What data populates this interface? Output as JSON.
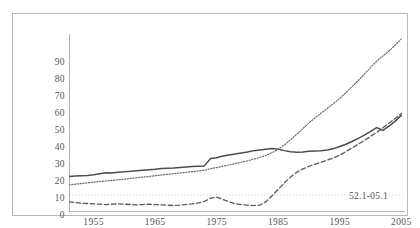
{
  "chart_data": {
    "type": "line",
    "title": "",
    "subtitle": "",
    "xlabel": "",
    "ylabel": "",
    "xlim": [
      1951,
      2005.6
    ],
    "ylim": [
      -10,
      95
    ],
    "yticks": [
      -10,
      0,
      10,
      20,
      30,
      40,
      50,
      60,
      70,
      80,
      90
    ],
    "ytick_labels": [
      "-10",
      "0",
      "10",
      "20",
      "30",
      "40",
      "50",
      "60",
      "70",
      "80",
      "90"
    ],
    "xticks": [
      1955,
      1965,
      1975,
      1985,
      1995,
      2005
    ],
    "xtick_labels": [
      "1955",
      "1965",
      "1975",
      "1985",
      "1995",
      "2005"
    ],
    "x_minor_ticks": [
      1960,
      1970,
      1980,
      1990,
      2000
    ],
    "grid": false,
    "legend": "none",
    "reference_lines": [
      {
        "axis": "y",
        "value": 0,
        "style": "dotted",
        "color": "#bdbdbd"
      }
    ],
    "annotations": [
      {
        "text": "52.1-05.1",
        "x": 1996.5,
        "y": 2.5
      }
    ],
    "colors": {
      "solid": "#4d4d4d",
      "dotted": "#6e6e6e",
      "dashed": "#5a5a5a",
      "axis": "#6b6b6b",
      "frame": "#b9b9b9"
    },
    "x": [
      1951,
      1952,
      1953,
      1954,
      1955,
      1956,
      1957,
      1958,
      1959,
      1960,
      1961,
      1962,
      1963,
      1964,
      1965,
      1966,
      1967,
      1968,
      1969,
      1970,
      1971,
      1972,
      1973,
      1974,
      1975,
      1976,
      1977,
      1978,
      1979,
      1980,
      1981,
      1982,
      1983,
      1984,
      1985,
      1986,
      1987,
      1988,
      1989,
      1990,
      1991,
      1992,
      1993,
      1994,
      1995,
      1996,
      1997,
      1998,
      1999,
      2000,
      2001,
      2002,
      2003,
      2004,
      2005
    ],
    "series": [
      {
        "name": "solid-series",
        "style": "solid",
        "values": [
          11.0,
          11.2,
          11.4,
          11.6,
          12.0,
          12.6,
          13.2,
          13.0,
          13.4,
          13.8,
          14.0,
          14.3,
          14.6,
          14.9,
          15.2,
          15.6,
          15.8,
          16.0,
          16.3,
          16.6,
          16.8,
          17.0,
          17.2,
          21.5,
          22.0,
          23.0,
          23.6,
          24.2,
          24.8,
          25.4,
          26.2,
          26.6,
          27.0,
          27.4,
          27.0,
          26.2,
          25.6,
          25.2,
          25.4,
          25.8,
          26.0,
          26.2,
          26.6,
          27.4,
          28.6,
          30.0,
          31.6,
          33.4,
          35.4,
          37.6,
          39.8,
          38.2,
          40.6,
          43.6,
          47.0
        ]
      },
      {
        "name": "dotted-series",
        "style": "dotted",
        "values": [
          6.0,
          6.4,
          6.8,
          7.2,
          7.6,
          8.0,
          8.3,
          8.6,
          9.0,
          9.4,
          9.8,
          10.2,
          10.6,
          11.0,
          11.4,
          11.8,
          12.2,
          12.6,
          13.0,
          13.4,
          13.8,
          14.2,
          14.6,
          15.6,
          16.2,
          17.0,
          17.8,
          18.6,
          19.4,
          20.2,
          21.2,
          22.2,
          23.4,
          25.0,
          27.0,
          29.6,
          32.6,
          35.8,
          39.2,
          42.6,
          45.6,
          48.4,
          51.2,
          54.0,
          57.0,
          60.4,
          64.0,
          67.6,
          71.4,
          75.2,
          79.0,
          82.0,
          85.0,
          88.4,
          92.0
        ]
      },
      {
        "name": "dashed-series",
        "style": "dashed",
        "values": [
          -4.0,
          -4.4,
          -4.8,
          -5.0,
          -5.2,
          -5.4,
          -5.6,
          -5.4,
          -5.2,
          -5.4,
          -5.6,
          -5.8,
          -5.6,
          -5.4,
          -5.6,
          -5.8,
          -6.0,
          -6.2,
          -6.0,
          -5.6,
          -5.2,
          -4.6,
          -3.8,
          -1.8,
          -1.2,
          -2.6,
          -4.0,
          -5.0,
          -5.6,
          -6.0,
          -6.2,
          -6.0,
          -4.0,
          -0.4,
          3.4,
          7.2,
          10.6,
          13.4,
          15.4,
          17.0,
          18.2,
          19.4,
          20.6,
          22.0,
          23.6,
          25.6,
          27.8,
          30.0,
          32.2,
          34.6,
          37.0,
          39.6,
          42.4,
          45.2,
          48.0
        ]
      }
    ]
  }
}
